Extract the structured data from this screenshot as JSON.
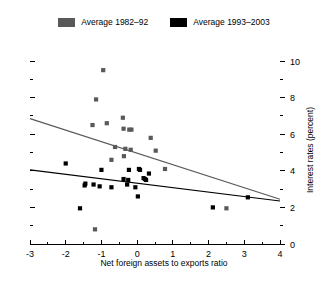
{
  "legend": {
    "entries": [
      {
        "label": "Average 1982–92",
        "color": "#595959",
        "swatch_name": "legend-swatch-gray"
      },
      {
        "label": "Average 1993–2003",
        "color": "#000000",
        "swatch_name": "legend-swatch-black"
      }
    ]
  },
  "chart_data": {
    "type": "scatter",
    "title": "",
    "xlabel": "Net foreign assets to exports ratio",
    "ylabel": "Interest rates (percent)",
    "xlim": [
      -3,
      4
    ],
    "ylim": [
      0,
      10
    ],
    "xticks": [
      -3,
      -2,
      -1,
      0,
      1,
      2,
      3,
      4
    ],
    "xticklabels": [
      "-3",
      "-2",
      "-1",
      "0",
      "1",
      "2",
      "3",
      "4"
    ],
    "yticks": [
      0,
      2,
      4,
      6,
      8,
      10
    ],
    "yticklabels": [
      "0",
      "2",
      "4",
      "6",
      "8",
      "10"
    ],
    "yminorticks": [
      1,
      3,
      5,
      7,
      9
    ],
    "y_axis_position": "right",
    "left_axis_ticks_unlabeled": true,
    "grid": false,
    "legend_position": "top-center",
    "series": [
      {
        "name": "Average 1982–92",
        "color": "#595959",
        "marker": "square",
        "points": [
          [
            -0.95,
            9.5
          ],
          [
            -1.15,
            7.9
          ],
          [
            -0.4,
            6.9
          ],
          [
            -0.85,
            6.6
          ],
          [
            -0.38,
            6.3
          ],
          [
            -0.22,
            6.25
          ],
          [
            -0.16,
            6.25
          ],
          [
            -1.25,
            6.5
          ],
          [
            0.38,
            5.8
          ],
          [
            -0.62,
            5.3
          ],
          [
            -0.33,
            5.2
          ],
          [
            -0.18,
            5.15
          ],
          [
            0.52,
            5.1
          ],
          [
            -0.37,
            4.8
          ],
          [
            -0.72,
            4.6
          ],
          [
            0.78,
            4.1
          ],
          [
            -1.18,
            0.8
          ],
          [
            2.5,
            1.95
          ]
        ]
      },
      {
        "name": "Average 1993–2003",
        "color": "#000000",
        "marker": "square",
        "points": [
          [
            -2.0,
            4.4
          ],
          [
            -1.0,
            4.05
          ],
          [
            -0.23,
            4.05
          ],
          [
            0.05,
            4.1
          ],
          [
            0.08,
            4.05
          ],
          [
            0.33,
            3.85
          ],
          [
            -0.38,
            3.55
          ],
          [
            -0.25,
            3.5
          ],
          [
            0.18,
            3.6
          ],
          [
            0.22,
            3.55
          ],
          [
            0.25,
            3.5
          ],
          [
            -1.45,
            3.3
          ],
          [
            -1.47,
            3.2
          ],
          [
            -1.22,
            3.25
          ],
          [
            -1.05,
            3.15
          ],
          [
            -0.72,
            3.1
          ],
          [
            -0.28,
            3.25
          ],
          [
            -0.05,
            3.1
          ],
          [
            0.02,
            2.6
          ],
          [
            -1.6,
            1.95
          ],
          [
            2.12,
            2.0
          ],
          [
            3.1,
            2.55
          ]
        ]
      }
    ],
    "trend_lines": [
      {
        "name": "Average 1982–92 trend",
        "color": "#595959",
        "x0": -3.0,
        "y0": 6.85,
        "x1": 4.0,
        "y1": 2.45
      },
      {
        "name": "Average 1993–2003 trend",
        "color": "#000000",
        "x0": -3.0,
        "y0": 4.05,
        "x1": 4.0,
        "y1": 2.35
      }
    ]
  }
}
